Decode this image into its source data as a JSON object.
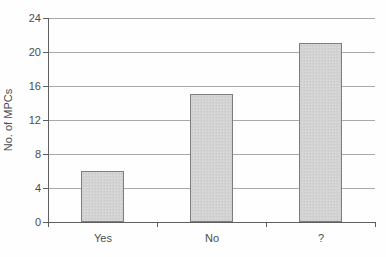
{
  "chart_data": {
    "type": "bar",
    "categories": [
      "Yes",
      "No",
      "?"
    ],
    "values": [
      6,
      15,
      21
    ],
    "title": "",
    "xlabel": "",
    "ylabel": "No. of MPCs",
    "ylim": [
      0,
      24
    ],
    "yticks": [
      0,
      4,
      8,
      12,
      16,
      20,
      24
    ],
    "grid": true,
    "legend": "none",
    "colors": {
      "bar_fill": "#d3d3d3",
      "bar_border": "#7e7e7e",
      "gridline": "#a9a9a9",
      "axis": "#5f5f5f",
      "text": "#4c4c4c",
      "background": "#fefefe"
    }
  }
}
